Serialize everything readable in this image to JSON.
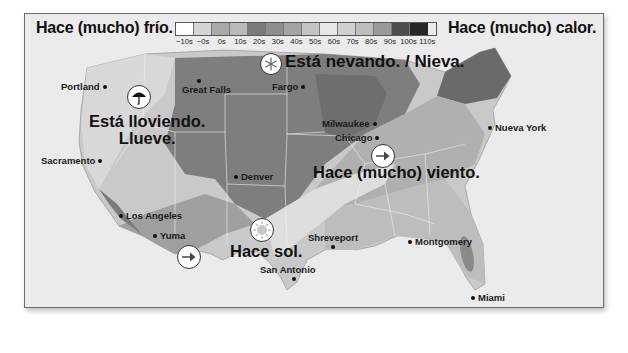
{
  "header": {
    "cold_label": "Hace (mucho) frío.",
    "hot_label": "Hace (mucho) calor."
  },
  "legend": {
    "items": [
      {
        "label": "−10s",
        "color": "#ffffff"
      },
      {
        "label": "−0s",
        "color": "#d4d4d4"
      },
      {
        "label": "0s",
        "color": "#a9a9a9"
      },
      {
        "label": "10s",
        "color": "#b9b9b9"
      },
      {
        "label": "20s",
        "color": "#7a7a7a"
      },
      {
        "label": "30s",
        "color": "#8d8d8d"
      },
      {
        "label": "40s",
        "color": "#a4a4a4"
      },
      {
        "label": "50s",
        "color": "#c4c4c4"
      },
      {
        "label": "60s",
        "color": "#e6e6e6"
      },
      {
        "label": "70s",
        "color": "#d0d0d0"
      },
      {
        "label": "80s",
        "color": "#bdbdbd"
      },
      {
        "label": "90s",
        "color": "#9a9a9a"
      },
      {
        "label": "100s",
        "color": "#4d4d4d"
      },
      {
        "label": "110s",
        "color": "#262626"
      }
    ]
  },
  "weather_captions": {
    "snow": "Está nevando. / Nieva.",
    "rain_line1": "Está lloviendo.",
    "rain_line2": "Llueve.",
    "wind": "Hace (mucho) viento.",
    "sun": "Hace sol."
  },
  "icons": {
    "snow": "snowflake-icon",
    "rain": "umbrella-icon",
    "wind_east": "arrow-right-icon",
    "wind_southwest": "arrow-right-icon",
    "sun": "sun-icon"
  },
  "cities": [
    {
      "name": "Portland"
    },
    {
      "name": "Great Falls"
    },
    {
      "name": "Fargo"
    },
    {
      "name": "Sacramento"
    },
    {
      "name": "Milwaukee"
    },
    {
      "name": "Chicago"
    },
    {
      "name": "Nueva York"
    },
    {
      "name": "Denver"
    },
    {
      "name": "Los Angeles"
    },
    {
      "name": "Yuma"
    },
    {
      "name": "Shreveport"
    },
    {
      "name": "Montgomery"
    },
    {
      "name": "San Antonio"
    },
    {
      "name": "Miami"
    }
  ]
}
